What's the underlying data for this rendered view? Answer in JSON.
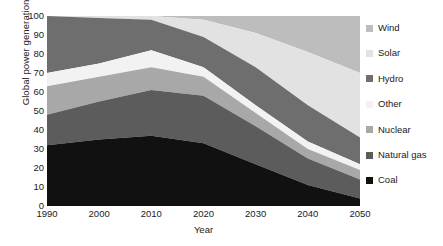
{
  "chart_data": {
    "type": "area",
    "stacked": true,
    "title": "",
    "xlabel": "Year",
    "ylabel": "Global power generation (%)",
    "x": [
      1990,
      2000,
      2010,
      2020,
      2030,
      2040,
      2050
    ],
    "xlim": [
      1990,
      2050
    ],
    "ylim": [
      0,
      100
    ],
    "xticks": [
      "1990",
      "2000",
      "2010",
      "2020",
      "2030",
      "2040",
      "2050"
    ],
    "yticks": [
      "0",
      "10",
      "20",
      "30",
      "40",
      "50",
      "60",
      "70",
      "80",
      "90",
      "100"
    ],
    "grid": false,
    "legend_position": "right",
    "stack_order_bottom_to_top": [
      "Coal",
      "Natural gas",
      "Nuclear",
      "Other",
      "Hydro",
      "Solar",
      "Wind"
    ],
    "series": [
      {
        "name": "Coal",
        "color": "#111111",
        "values": [
          32,
          35,
          37,
          33,
          22,
          11,
          4
        ],
        "cumulative_top": [
          32,
          35,
          37,
          33,
          22,
          11,
          4
        ]
      },
      {
        "name": "Natural gas",
        "color": "#5c5c5c",
        "values": [
          16,
          20,
          24,
          25,
          20,
          14,
          10
        ],
        "cumulative_top": [
          48,
          55,
          61,
          58,
          42,
          25,
          14
        ]
      },
      {
        "name": "Nuclear",
        "color": "#a8a8a8",
        "values": [
          15,
          13,
          12,
          10,
          7,
          5,
          5
        ],
        "cumulative_top": [
          63,
          68,
          73,
          68,
          49,
          30,
          19
        ]
      },
      {
        "name": "Other",
        "color": "#f2f2f2",
        "values": [
          7,
          7,
          9,
          5,
          4,
          4,
          3
        ],
        "cumulative_top": [
          70,
          75,
          82,
          73,
          53,
          34,
          22
        ]
      },
      {
        "name": "Hydro",
        "color": "#6e6e6e",
        "values": [
          30,
          24,
          16,
          16,
          20,
          19,
          14
        ],
        "cumulative_top": [
          100,
          99,
          98,
          89,
          73,
          53,
          36
        ]
      },
      {
        "name": "Solar",
        "color": "#e2e2e2",
        "values": [
          0,
          1,
          2,
          9,
          18,
          28,
          34
        ],
        "cumulative_top": [
          100,
          100,
          100,
          98,
          91,
          81,
          70
        ]
      },
      {
        "name": "Wind",
        "color": "#bdbdbd",
        "values": [
          0,
          0,
          0,
          2,
          9,
          19,
          30
        ],
        "cumulative_top": [
          100,
          100,
          100,
          100,
          100,
          100,
          100
        ]
      }
    ]
  },
  "legend": {
    "items": [
      {
        "label": "Wind",
        "color": "#bdbdbd"
      },
      {
        "label": "Solar",
        "color": "#e2e2e2"
      },
      {
        "label": "Hydro",
        "color": "#6e6e6e"
      },
      {
        "label": "Other",
        "color": "#f2f2f2"
      },
      {
        "label": "Nuclear",
        "color": "#a8a8a8"
      },
      {
        "label": "Natural gas",
        "color": "#5c5c5c"
      },
      {
        "label": "Coal",
        "color": "#111111"
      }
    ]
  }
}
